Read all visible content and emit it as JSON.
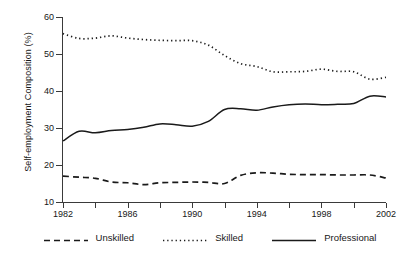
{
  "chart_data": {
    "type": "line",
    "title": "",
    "xlabel": "",
    "ylabel": "Self-employment Composition (%)",
    "xlim": [
      1982,
      2002
    ],
    "ylim": [
      10,
      60
    ],
    "grid": false,
    "legend_position": "bottom",
    "yticks": [
      10,
      20,
      30,
      40,
      50,
      60
    ],
    "ytick_labels": [
      "10",
      "20",
      "30",
      "40",
      "50",
      "60"
    ],
    "xticks": [
      1982,
      1984,
      1986,
      1988,
      1990,
      1992,
      1994,
      1996,
      1998,
      2000,
      2002
    ],
    "xtick_labels": [
      "1982",
      "",
      "1986",
      "",
      "1990",
      "",
      "1994",
      "",
      "1998",
      "",
      "2002"
    ],
    "x": [
      1982,
      1983,
      1984,
      1985,
      1986,
      1987,
      1988,
      1989,
      1990,
      1991,
      1992,
      1993,
      1994,
      1995,
      1996,
      1997,
      1998,
      1999,
      2000,
      2001,
      2002
    ],
    "series": [
      {
        "name": "Unskilled",
        "style": "dashed",
        "color": "#1a1a1a",
        "values": [
          17.0,
          16.7,
          16.4,
          15.4,
          15.2,
          14.7,
          15.2,
          15.3,
          15.4,
          15.3,
          15.0,
          17.2,
          17.9,
          17.8,
          17.5,
          17.4,
          17.4,
          17.3,
          17.3,
          17.3,
          16.5
        ]
      },
      {
        "name": "Skilled",
        "style": "dotted",
        "color": "#1a1a1a",
        "values": [
          55.5,
          54.2,
          54.3,
          54.9,
          54.3,
          53.9,
          53.7,
          53.6,
          53.6,
          52.4,
          49.6,
          47.4,
          46.6,
          45.2,
          45.2,
          45.3,
          45.9,
          45.3,
          45.2,
          43.2,
          43.7
        ]
      },
      {
        "name": "Professional",
        "style": "solid",
        "color": "#1a1a1a",
        "values": [
          26.5,
          29.1,
          28.7,
          29.3,
          29.6,
          30.2,
          31.1,
          30.9,
          30.5,
          31.8,
          35.0,
          35.2,
          34.8,
          35.7,
          36.3,
          36.5,
          36.3,
          36.4,
          36.6,
          38.6,
          38.4
        ]
      }
    ]
  },
  "legend": {
    "items": [
      {
        "label": "Unskilled",
        "key": "dashed-line-key"
      },
      {
        "label": "Skilled",
        "key": "dotted-line-key"
      },
      {
        "label": "Professional",
        "key": "solid-line-key"
      }
    ]
  }
}
